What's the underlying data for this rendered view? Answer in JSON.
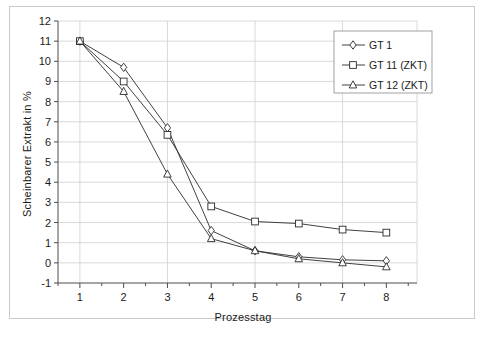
{
  "chart_data": {
    "type": "line",
    "title": "",
    "xlabel": "Prozesstag",
    "ylabel": "Scheinbarer Extrakt in %",
    "x": [
      1,
      2,
      3,
      4,
      5,
      6,
      7,
      8
    ],
    "xlim": [
      0.5,
      8.7
    ],
    "ylim": [
      -1,
      12
    ],
    "xticks": [
      1,
      2,
      3,
      4,
      5,
      6,
      7,
      8
    ],
    "yticks": [
      -1,
      0,
      1,
      2,
      3,
      4,
      5,
      6,
      7,
      8,
      9,
      10,
      11,
      12
    ],
    "grid": true,
    "legend_position": "top-right",
    "series": [
      {
        "name": "GT 1",
        "marker": "diamond",
        "values": [
          11.0,
          9.7,
          6.7,
          1.6,
          0.6,
          0.3,
          0.15,
          0.1
        ]
      },
      {
        "name": "GT 11 (ZKT)",
        "marker": "square",
        "values": [
          11.0,
          9.0,
          6.35,
          2.8,
          2.05,
          1.95,
          1.65,
          1.5
        ]
      },
      {
        "name": "GT 12 (ZKT)",
        "marker": "triangle",
        "values": [
          11.0,
          8.5,
          4.4,
          1.2,
          0.6,
          0.2,
          0.0,
          -0.2
        ]
      }
    ]
  },
  "colors": {
    "line": "#2b2b2b",
    "grid": "#d0d0d0",
    "axis": "#4d4d4d",
    "frame": "#c9c9c9",
    "background": "#ffffff"
  }
}
